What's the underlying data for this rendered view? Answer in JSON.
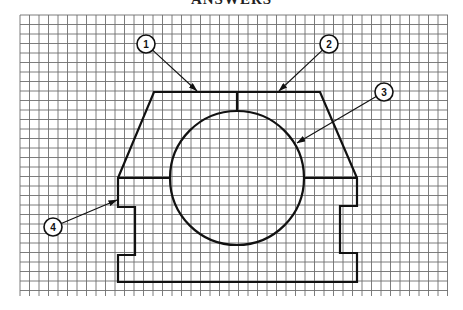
{
  "header": {
    "title": "ANSWERS"
  },
  "grid": {
    "x_start": 20,
    "x_end": 448,
    "y_start": 15,
    "y_end": 296,
    "spacing": 9.5,
    "line_color": "#6e6e6e"
  },
  "drawing": {
    "stroke_color": "#111111",
    "outline_points": "154,92 320,92 357,178 357,206 340,206 340,253 357,253 357,282 118,282 118,255 135,255 135,207 118,207 118,178",
    "circle": {
      "cx": 237,
      "cy": 178,
      "r": 67
    },
    "center_line": {
      "x": 237,
      "y1": 92,
      "y2": 111
    },
    "split_line_left": {
      "x1": 118,
      "x2": 170,
      "y": 178
    },
    "split_line_right": {
      "x1": 304,
      "x2": 357,
      "y": 178
    }
  },
  "callouts": [
    {
      "label": "1",
      "cx": 146,
      "cy": 44,
      "tip_x": 197,
      "tip_y": 91
    },
    {
      "label": "2",
      "cx": 329,
      "cy": 44,
      "tip_x": 279,
      "tip_y": 91
    },
    {
      "label": "3",
      "cx": 384,
      "cy": 92,
      "tip_x": 297,
      "tip_y": 143
    },
    {
      "label": "4",
      "cx": 53,
      "cy": 227,
      "tip_x": 117,
      "tip_y": 200
    }
  ]
}
